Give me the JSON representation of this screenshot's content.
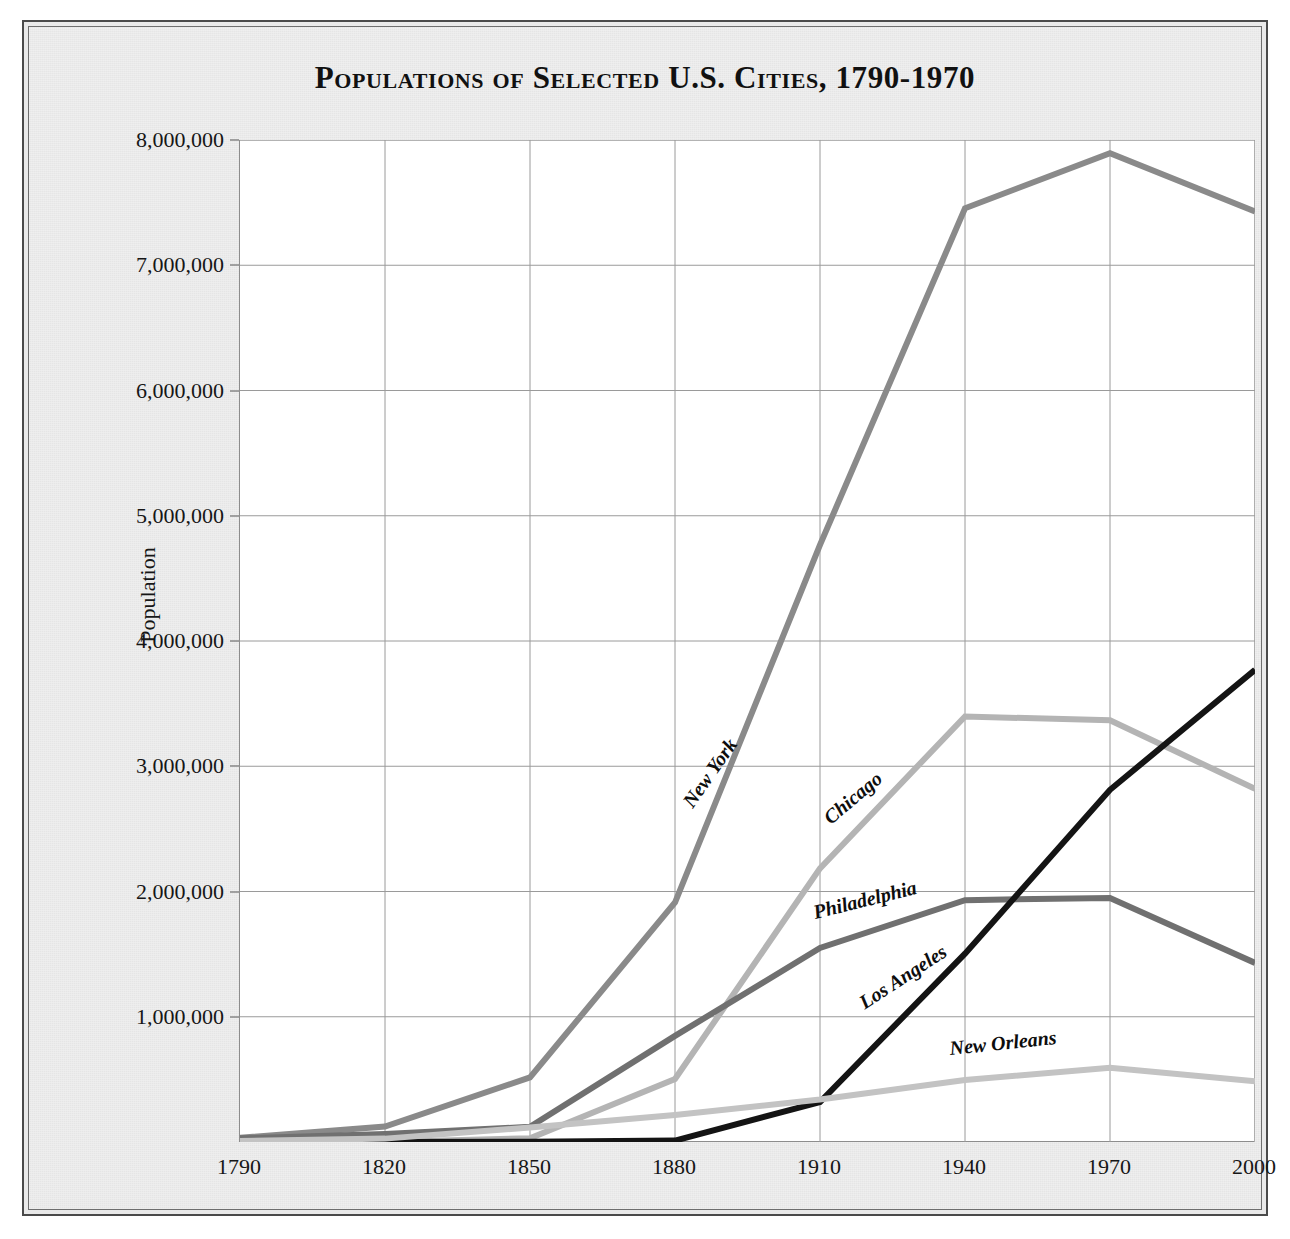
{
  "figure": {
    "title": "Populations of Selected U.S. Cities, 1790-1970",
    "background_color": "#e9e9e9",
    "plot_background_color": "#ffffff",
    "frame_color": "#4a4a4a"
  },
  "axes": {
    "y_title": "Population",
    "y_tick_labels": [
      "8,000,000",
      "7,000,000",
      "6,000,000",
      "5,000,000",
      "4,000,000",
      "3,000,000",
      "2,000,000",
      "1,000,000"
    ],
    "x_tick_labels": [
      "1790",
      "1820",
      "1850",
      "1880",
      "1910",
      "1940",
      "1970",
      "2000"
    ]
  },
  "series_labels": [
    {
      "name": "New York",
      "rotation": -55
    },
    {
      "name": "Chicago",
      "rotation": -40
    },
    {
      "name": "Philadelphia",
      "rotation": -14
    },
    {
      "name": "Los Angeles",
      "rotation": -33
    },
    {
      "name": "New Orleans",
      "rotation": -6
    }
  ],
  "chart_data": {
    "type": "line",
    "title": "Populations of Selected U.S. Cities, 1790-1970",
    "xlabel": "",
    "ylabel": "Population",
    "x": [
      1790,
      1820,
      1850,
      1880,
      1910,
      1940,
      1970,
      2000
    ],
    "xlim": [
      1790,
      2000
    ],
    "ylim": [
      0,
      8000000
    ],
    "ytick_values": [
      1000000,
      2000000,
      3000000,
      4000000,
      5000000,
      6000000,
      7000000,
      8000000
    ],
    "grid": true,
    "legend": "inline-labels",
    "series": [
      {
        "name": "New York",
        "color": "#8a8a8a",
        "width": 6,
        "values": [
          33000,
          124000,
          516000,
          1912000,
          4767000,
          7455000,
          7895000,
          7430000
        ]
      },
      {
        "name": "Chicago",
        "color": "#b4b4b4",
        "width": 6,
        "values": [
          0,
          0,
          30000,
          503000,
          2185000,
          3397000,
          3367000,
          2820000
        ]
      },
      {
        "name": "Philadelphia",
        "color": "#707070",
        "width": 6,
        "values": [
          29000,
          64000,
          121000,
          847000,
          1549000,
          1931000,
          1949000,
          1430000
        ]
      },
      {
        "name": "Los Angeles",
        "color": "#141414",
        "width": 6,
        "values": [
          0,
          0,
          2000,
          11000,
          319000,
          1504000,
          2812000,
          3770000
        ]
      },
      {
        "name": "New Orleans",
        "color": "#c3c3c3",
        "width": 6,
        "values": [
          8000,
          27000,
          116000,
          216000,
          339000,
          495000,
          593000,
          485000
        ]
      }
    ]
  }
}
